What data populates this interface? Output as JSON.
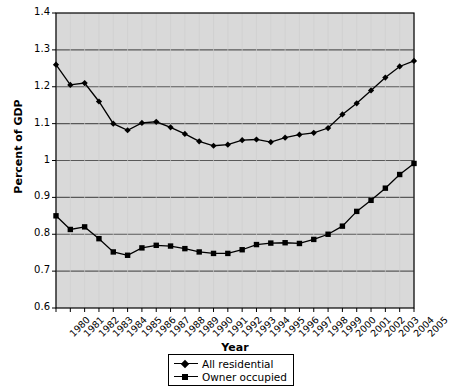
{
  "chart_data": {
    "type": "line",
    "title": "",
    "xlabel": "Year",
    "ylabel": "Percent of GDP",
    "xlim": [
      1980,
      2005
    ],
    "ylim": [
      0.6,
      1.4
    ],
    "yticks": [
      0.6,
      0.7,
      0.8,
      0.9,
      1.0,
      1.1,
      1.2,
      1.3,
      1.4
    ],
    "ytick_labels": [
      "0.6",
      "0.7",
      "0.8",
      "0.9",
      "1",
      "1.1",
      "1.2",
      "1.3",
      "1.4"
    ],
    "grid": true,
    "grid_axis": "y",
    "plot_background": "#d9d9d9",
    "legend_position": "bottom-center",
    "categories": [
      "1980",
      "1981",
      "1982",
      "1983",
      "1984",
      "1985",
      "1986",
      "1987",
      "1988",
      "1989",
      "1990",
      "1991",
      "1992",
      "1993",
      "1994",
      "1995",
      "1996",
      "1997",
      "1998",
      "1999",
      "2000",
      "2001",
      "2002",
      "2003",
      "2004",
      "2005"
    ],
    "series": [
      {
        "name": "All residential",
        "marker": "diamond",
        "color": "#000000",
        "values": [
          1.26,
          1.205,
          1.21,
          1.16,
          1.1,
          1.082,
          1.102,
          1.105,
          1.09,
          1.072,
          1.052,
          1.04,
          1.043,
          1.055,
          1.057,
          1.05,
          1.062,
          1.07,
          1.075,
          1.088,
          1.125,
          1.155,
          1.19,
          1.225,
          1.255,
          1.27
        ]
      },
      {
        "name": "Owner occupied",
        "marker": "square",
        "color": "#000000",
        "values": [
          0.85,
          0.813,
          0.82,
          0.788,
          0.752,
          0.743,
          0.763,
          0.77,
          0.768,
          0.761,
          0.752,
          0.748,
          0.748,
          0.758,
          0.772,
          0.776,
          0.777,
          0.775,
          0.786,
          0.8,
          0.822,
          0.862,
          0.892,
          0.925,
          0.962,
          0.992
        ]
      }
    ]
  },
  "legend": {
    "entries": [
      {
        "label": "All residential",
        "marker": "diamond"
      },
      {
        "label": "Owner occupied",
        "marker": "square"
      }
    ]
  },
  "axis": {
    "y_title": "Percent of GDP",
    "x_title": "Year"
  }
}
